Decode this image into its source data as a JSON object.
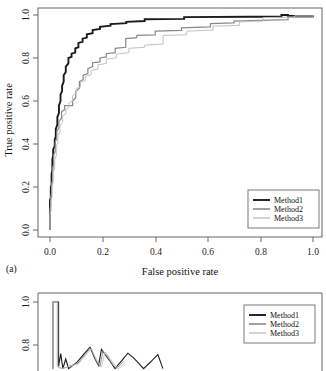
{
  "figure": {
    "panels": [
      {
        "tag": "(a)",
        "id": "panel-a"
      },
      {
        "tag": "",
        "id": "panel-b"
      }
    ]
  },
  "colors": {
    "method1": "#1b1b1b",
    "method2": "#8a8a8a",
    "method3": "#c2c2c2",
    "axis": "#555555",
    "legend_border": "#6b6b6b",
    "background": "#ffffff"
  },
  "panel_a": {
    "xlabel": "False positive rate",
    "ylabel": "True positive rate",
    "panel_tag": "(a)",
    "xticks": [
      "0.0",
      "0.2",
      "0.4",
      "0.6",
      "0.8",
      "1.0"
    ],
    "yticks": [
      "0.0",
      "0.2",
      "0.4",
      "0.6",
      "0.8",
      "1.0"
    ],
    "legend": {
      "items": [
        {
          "label": "Method1",
          "color": "#1b1b1b",
          "width": 1.9
        },
        {
          "label": "Method2",
          "color": "#8a8a8a",
          "width": 1.3
        },
        {
          "label": "Method3",
          "color": "#c2c2c2",
          "width": 1.1
        }
      ]
    }
  },
  "panel_b": {
    "yticks": [
      "0.8",
      "1.0"
    ],
    "legend": {
      "items": [
        {
          "label": "Method1",
          "color": "#1b1b1b",
          "width": 1.9
        },
        {
          "label": "Method2",
          "color": "#8a8a8a",
          "width": 1.3
        },
        {
          "label": "Method3",
          "color": "#c2c2c2",
          "width": 1.1
        }
      ]
    }
  },
  "chart_data": [
    {
      "type": "line",
      "id": "panel-a-roc",
      "title": "",
      "subtitle": "(a)",
      "xlabel": "False positive rate",
      "ylabel": "True positive rate",
      "xlim": [
        0.0,
        1.0
      ],
      "ylim": [
        0.0,
        1.0
      ],
      "xticks": [
        0.0,
        0.2,
        0.4,
        0.6,
        0.8,
        1.0
      ],
      "yticks": [
        0.0,
        0.2,
        0.4,
        0.6,
        0.8,
        1.0
      ],
      "grid": false,
      "legend_position": "bottom-right",
      "drawstyle": "steps-post",
      "series": [
        {
          "name": "Method1",
          "color": "#1b1b1b",
          "points": [
            [
              0.0,
              0.0
            ],
            [
              0.0,
              0.14
            ],
            [
              0.003,
              0.15
            ],
            [
              0.003,
              0.2
            ],
            [
              0.006,
              0.21
            ],
            [
              0.006,
              0.26
            ],
            [
              0.009,
              0.28
            ],
            [
              0.009,
              0.33
            ],
            [
              0.012,
              0.345
            ],
            [
              0.012,
              0.375
            ],
            [
              0.018,
              0.39
            ],
            [
              0.018,
              0.42
            ],
            [
              0.022,
              0.435
            ],
            [
              0.022,
              0.47
            ],
            [
              0.028,
              0.49
            ],
            [
              0.028,
              0.525
            ],
            [
              0.034,
              0.545
            ],
            [
              0.034,
              0.58
            ],
            [
              0.04,
              0.6
            ],
            [
              0.04,
              0.63
            ],
            [
              0.046,
              0.645
            ],
            [
              0.046,
              0.67
            ],
            [
              0.052,
              0.69
            ],
            [
              0.052,
              0.72
            ],
            [
              0.06,
              0.735
            ],
            [
              0.06,
              0.76
            ],
            [
              0.07,
              0.775
            ],
            [
              0.07,
              0.8
            ],
            [
              0.082,
              0.805
            ],
            [
              0.082,
              0.82
            ],
            [
              0.096,
              0.825
            ],
            [
              0.096,
              0.845
            ],
            [
              0.108,
              0.85
            ],
            [
              0.108,
              0.87
            ],
            [
              0.124,
              0.875
            ],
            [
              0.124,
              0.89
            ],
            [
              0.14,
              0.895
            ],
            [
              0.14,
              0.91
            ],
            [
              0.162,
              0.915
            ],
            [
              0.162,
              0.93
            ],
            [
              0.19,
              0.935
            ],
            [
              0.19,
              0.945
            ],
            [
              0.23,
              0.95
            ],
            [
              0.23,
              0.958
            ],
            [
              0.29,
              0.962
            ],
            [
              0.29,
              0.968
            ],
            [
              0.36,
              0.972
            ],
            [
              0.36,
              0.98
            ],
            [
              0.51,
              0.982
            ],
            [
              0.51,
              0.99
            ],
            [
              0.76,
              0.992
            ],
            [
              0.88,
              0.992
            ],
            [
              0.88,
              1.0
            ],
            [
              0.905,
              1.0
            ],
            [
              0.905,
              0.995
            ],
            [
              1.0,
              0.995
            ],
            [
              1.0,
              1.0
            ]
          ]
        },
        {
          "name": "Method2",
          "color": "#8a8a8a",
          "points": [
            [
              0.0,
              0.0
            ],
            [
              0.0,
              0.095
            ],
            [
              0.003,
              0.11
            ],
            [
              0.003,
              0.155
            ],
            [
              0.006,
              0.17
            ],
            [
              0.006,
              0.215
            ],
            [
              0.01,
              0.23
            ],
            [
              0.01,
              0.29
            ],
            [
              0.014,
              0.305
            ],
            [
              0.014,
              0.35
            ],
            [
              0.02,
              0.365
            ],
            [
              0.02,
              0.41
            ],
            [
              0.026,
              0.425
            ],
            [
              0.026,
              0.46
            ],
            [
              0.034,
              0.475
            ],
            [
              0.034,
              0.505
            ],
            [
              0.044,
              0.52
            ],
            [
              0.044,
              0.55
            ],
            [
              0.056,
              0.56
            ],
            [
              0.056,
              0.578
            ],
            [
              0.086,
              0.578
            ],
            [
              0.086,
              0.6
            ],
            [
              0.098,
              0.615
            ],
            [
              0.098,
              0.645
            ],
            [
              0.112,
              0.66
            ],
            [
              0.112,
              0.69
            ],
            [
              0.126,
              0.7
            ],
            [
              0.126,
              0.72
            ],
            [
              0.144,
              0.728
            ],
            [
              0.144,
              0.75
            ],
            [
              0.162,
              0.76
            ],
            [
              0.162,
              0.778
            ],
            [
              0.19,
              0.782
            ],
            [
              0.19,
              0.8
            ],
            [
              0.214,
              0.805
            ],
            [
              0.214,
              0.82
            ],
            [
              0.248,
              0.825
            ],
            [
              0.248,
              0.845
            ],
            [
              0.288,
              0.85
            ],
            [
              0.288,
              0.89
            ],
            [
              0.33,
              0.895
            ],
            [
              0.33,
              0.905
            ],
            [
              0.4,
              0.908
            ],
            [
              0.4,
              0.925
            ],
            [
              0.5,
              0.928
            ],
            [
              0.5,
              0.94
            ],
            [
              0.61,
              0.945
            ],
            [
              0.61,
              0.96
            ],
            [
              0.7,
              0.963
            ],
            [
              0.7,
              0.972
            ],
            [
              0.8,
              0.975
            ],
            [
              0.905,
              0.978
            ],
            [
              0.905,
              0.99
            ],
            [
              1.0,
              0.99
            ],
            [
              1.0,
              1.0
            ]
          ]
        },
        {
          "name": "Method3",
          "color": "#c2c2c2",
          "points": [
            [
              0.0,
              0.0
            ],
            [
              0.0,
              0.075
            ],
            [
              0.004,
              0.09
            ],
            [
              0.004,
              0.14
            ],
            [
              0.008,
              0.155
            ],
            [
              0.008,
              0.205
            ],
            [
              0.012,
              0.22
            ],
            [
              0.012,
              0.27
            ],
            [
              0.018,
              0.285
            ],
            [
              0.018,
              0.33
            ],
            [
              0.024,
              0.345
            ],
            [
              0.024,
              0.39
            ],
            [
              0.03,
              0.405
            ],
            [
              0.03,
              0.44
            ],
            [
              0.038,
              0.455
            ],
            [
              0.038,
              0.485
            ],
            [
              0.048,
              0.5
            ],
            [
              0.048,
              0.53
            ],
            [
              0.06,
              0.54
            ],
            [
              0.06,
              0.56
            ],
            [
              0.072,
              0.57
            ],
            [
              0.072,
              0.592
            ],
            [
              0.086,
              0.6
            ],
            [
              0.086,
              0.625
            ],
            [
              0.1,
              0.635
            ],
            [
              0.1,
              0.658
            ],
            [
              0.116,
              0.665
            ],
            [
              0.116,
              0.688
            ],
            [
              0.134,
              0.695
            ],
            [
              0.134,
              0.715
            ],
            [
              0.156,
              0.722
            ],
            [
              0.156,
              0.742
            ],
            [
              0.182,
              0.748
            ],
            [
              0.182,
              0.768
            ],
            [
              0.214,
              0.775
            ],
            [
              0.214,
              0.795
            ],
            [
              0.252,
              0.8
            ],
            [
              0.252,
              0.818
            ],
            [
              0.3,
              0.825
            ],
            [
              0.3,
              0.845
            ],
            [
              0.36,
              0.85
            ],
            [
              0.36,
              0.86
            ],
            [
              0.43,
              0.865
            ],
            [
              0.43,
              0.905
            ],
            [
              0.52,
              0.908
            ],
            [
              0.52,
              0.925
            ],
            [
              0.62,
              0.93
            ],
            [
              0.62,
              0.948
            ],
            [
              0.72,
              0.952
            ],
            [
              0.72,
              0.968
            ],
            [
              0.81,
              0.972
            ],
            [
              0.81,
              0.988
            ],
            [
              0.93,
              0.99
            ],
            [
              0.93,
              0.996
            ],
            [
              1.0,
              0.996
            ],
            [
              1.0,
              1.0
            ]
          ]
        }
      ]
    },
    {
      "type": "line",
      "id": "panel-b-partial",
      "title": "",
      "xlabel": "",
      "ylabel": "",
      "ylim": [
        0.68,
        1.03
      ],
      "yticks": [
        0.8,
        1.0
      ],
      "grid": false,
      "legend_position": "top-right",
      "note": "lower panel cropped at image bottom",
      "series": [
        {
          "name": "Method1",
          "color": "#1b1b1b",
          "points": [
            [
              0.022,
              0.69
            ],
            [
              0.022,
              1.0
            ],
            [
              0.038,
              1.0
            ],
            [
              0.038,
              0.7
            ],
            [
              0.044,
              0.76
            ],
            [
              0.05,
              0.69
            ],
            [
              0.058,
              0.735
            ],
            [
              0.066,
              0.69
            ],
            [
              0.09,
              0.72
            ],
            [
              0.11,
              0.76
            ],
            [
              0.126,
              0.79
            ],
            [
              0.14,
              0.735
            ],
            [
              0.15,
              0.705
            ],
            [
              0.158,
              0.78
            ],
            [
              0.172,
              0.748
            ],
            [
              0.186,
              0.715
            ],
            [
              0.196,
              0.69
            ],
            [
              0.216,
              0.73
            ],
            [
              0.232,
              0.762
            ],
            [
              0.248,
              0.74
            ],
            [
              0.262,
              0.716
            ],
            [
              0.276,
              0.69
            ],
            [
              0.296,
              0.722
            ],
            [
              0.316,
              0.756
            ],
            [
              0.33,
              0.69
            ]
          ]
        },
        {
          "name": "Method2",
          "color": "#8a8a8a",
          "points": [
            [
              0.022,
              0.69
            ],
            [
              0.022,
              1.0
            ],
            [
              0.036,
              1.0
            ],
            [
              0.036,
              0.7
            ],
            [
              0.048,
              0.69
            ],
            [
              0.092,
              0.715
            ],
            [
              0.112,
              0.755
            ],
            [
              0.128,
              0.788
            ],
            [
              0.142,
              0.73
            ],
            [
              0.154,
              0.7
            ],
            [
              0.162,
              0.772
            ],
            [
              0.176,
              0.742
            ],
            [
              0.19,
              0.708
            ],
            [
              0.2,
              0.69
            ],
            [
              0.22,
              0.725
            ]
          ]
        },
        {
          "name": "Method3",
          "color": "#c2c2c2",
          "points": [
            [
              0.022,
              0.69
            ],
            [
              0.022,
              1.0
            ],
            [
              0.034,
              1.0
            ],
            [
              0.034,
              0.7
            ],
            [
              0.046,
              0.69
            ],
            [
              0.094,
              0.712
            ],
            [
              0.114,
              0.752
            ],
            [
              0.13,
              0.784
            ],
            [
              0.146,
              0.726
            ],
            [
              0.158,
              0.698
            ],
            [
              0.168,
              0.768
            ],
            [
              0.182,
              0.738
            ],
            [
              0.196,
              0.704
            ],
            [
              0.206,
              0.69
            ],
            [
              0.226,
              0.72
            ]
          ]
        }
      ]
    }
  ]
}
